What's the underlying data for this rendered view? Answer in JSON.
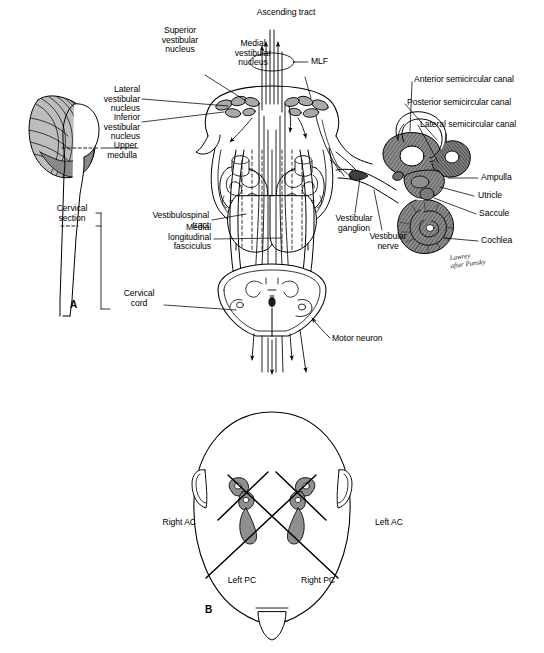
{
  "figure": {
    "background_color": "#ffffff",
    "ink_color": "#000000",
    "shade_color": "#9a9a9a",
    "shade_light": "#c9c9c9",
    "panels": [
      {
        "id": "A",
        "letter": "A"
      },
      {
        "id": "B",
        "letter": "B"
      }
    ]
  },
  "panel_a": {
    "letter": "A",
    "labels": {
      "ascending_tract": "Ascending tract",
      "superior_vestibular_nucleus": "Superior\nvestibular\nnucleus",
      "medial_vestibular_nucleus": "Medial\nvestibular\nnucleus",
      "lateral_vestibular_nucleus": "Lateral\nvestibular\nnucleus",
      "inferior_vestibular_nucleus": "Inferior\nvestibular\nnucleus",
      "upper_medulla": "Upper\nmedulla",
      "mlf": "MLF",
      "anterior_semicircular_canal": "Anterior semicircular canal",
      "posterior_semicircular_canal": "Posterior semicircular canal",
      "lateral_semicircular_canal": "Lateral semicircular canal",
      "ampulla": "Ampulla",
      "utricle": "Utricle",
      "saccule": "Saccule",
      "cochlea": "Cochlea",
      "vestibular_ganglion": "Vestibular\nganglion",
      "vestibular_nerve": "Vestibular\nnerve",
      "cervical_section": "Cervical\nsection",
      "vestibulospinal_tract": "Vestibulospinal\ntract",
      "medial_longitudinal_fasciculus": "Medial\nlongitudinal\nfasciculus",
      "cervical_cord": "Cervical\ncord",
      "motor_neuron": "Motor neuron"
    },
    "signature": "Lawrey\nafter Pansky"
  },
  "panel_b": {
    "letter": "B",
    "labels": {
      "right_ac": "Right AC",
      "left_ac": "Left AC",
      "left_pc": "Left PC",
      "right_pc": "Right PC"
    }
  }
}
